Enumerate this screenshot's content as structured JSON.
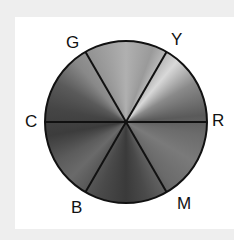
{
  "diagram": {
    "type": "color-wheel",
    "sectors": 6,
    "labels": {
      "top_right": "Y",
      "top_left": "G",
      "left": "C",
      "right": "R",
      "bottom_left": "B",
      "bottom_right": "M"
    },
    "colors": {
      "background": "#eeeeee",
      "card": "#ffffff",
      "stroke": "#111111"
    }
  }
}
